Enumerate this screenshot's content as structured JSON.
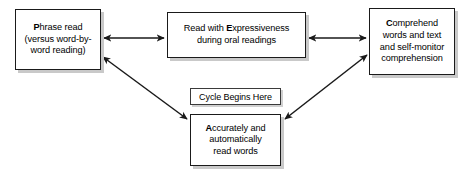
{
  "diagram": {
    "background_color": "#ffffff",
    "line_color": "#1a1a1a",
    "shadow_color": "#c9c9c9",
    "cycle_label": "Cycle Begins Here",
    "nodes": [
      {
        "id": "phrase",
        "lead_letter": "P",
        "rest": "hrase read\n(versus word-by-\nword reading)",
        "full_text": "Phrase read (versus word-by-word reading)"
      },
      {
        "id": "expressiveness",
        "pre": "Read with ",
        "lead_letter": "E",
        "rest": "xpressiveness\nduring oral readings",
        "full_text": "Read with Expressiveness during oral readings"
      },
      {
        "id": "comprehend",
        "lead_letter": "C",
        "rest": "omprehend\nwords and text\nand self-monitor\ncomprehension",
        "full_text": "Comprehend words and text and self-monitor comprehension"
      },
      {
        "id": "accurately",
        "lead_letter": "A",
        "rest": "ccurately and\nautomatically\nread words",
        "full_text": "Accurately and automatically read words"
      }
    ],
    "connectors": [
      {
        "id": "phrase-expressiveness",
        "type": "double-arrow",
        "orientation": "horizontal",
        "from": "phrase",
        "to": "expressiveness"
      },
      {
        "id": "expressiveness-comprehend",
        "type": "double-arrow",
        "orientation": "horizontal",
        "from": "expressiveness",
        "to": "comprehend"
      },
      {
        "id": "accurately-phrase",
        "type": "double-arrow",
        "orientation": "diagonal",
        "from": "accurately",
        "to": "phrase"
      },
      {
        "id": "accurately-comprehend",
        "type": "double-arrow",
        "orientation": "diagonal",
        "from": "accurately",
        "to": "comprehend"
      }
    ]
  }
}
